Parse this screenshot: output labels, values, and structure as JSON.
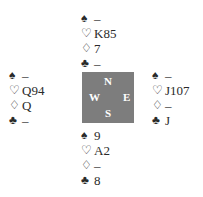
{
  "hands": {
    "north": {
      "spades": "–",
      "hearts": "K85",
      "diamonds": "7",
      "clubs": "–"
    },
    "west": {
      "spades": "–",
      "hearts": "Q94",
      "diamonds": "Q",
      "clubs": "–"
    },
    "east": {
      "spades": "–",
      "hearts": "J107",
      "diamonds": "–",
      "clubs": "J"
    },
    "south": {
      "spades": "9",
      "hearts": "A2",
      "diamonds": "–",
      "clubs": "8"
    }
  },
  "suit_symbols": {
    "spades": "♠",
    "hearts": "♡",
    "diamonds": "♢",
    "clubs": "♣"
  },
  "compass": {
    "n": "N",
    "s": "S",
    "w": "W",
    "e": "E",
    "color": "#7d7d7d"
  }
}
